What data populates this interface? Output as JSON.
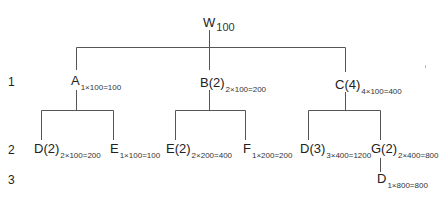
{
  "diagram": {
    "type": "tree",
    "levels": [
      {
        "id": "level-1",
        "label": "1"
      },
      {
        "id": "level-2",
        "label": "2"
      },
      {
        "id": "level-3",
        "label": "3"
      }
    ],
    "root": {
      "name": "W",
      "sub": "100"
    },
    "nodes": {
      "A": {
        "name": "A",
        "sub": "1×100=100"
      },
      "B": {
        "name": "B(2)",
        "sub": "2×100=200"
      },
      "C": {
        "name": "C(4)",
        "sub": "4×100=400"
      },
      "AD": {
        "name": "D(2)",
        "sub": "2×100=200"
      },
      "AE": {
        "name": "E",
        "sub": "1×100=100"
      },
      "BE": {
        "name": "E(2)",
        "sub": "2×200=400"
      },
      "BF": {
        "name": "F",
        "sub": "1×200=200"
      },
      "CD": {
        "name": "D(3)",
        "sub": "3×400=1200"
      },
      "CG": {
        "name": "G(2)",
        "sub": "2×400=800"
      },
      "GD": {
        "name": "D",
        "sub": "1×800=800"
      }
    },
    "edges": [
      [
        "W",
        "A"
      ],
      [
        "W",
        "B(2)"
      ],
      [
        "W",
        "C(4)"
      ],
      [
        "A",
        "D(2)"
      ],
      [
        "A",
        "E"
      ],
      [
        "B(2)",
        "E(2)"
      ],
      [
        "B(2)",
        "F"
      ],
      [
        "C(4)",
        "D(3)"
      ],
      [
        "C(4)",
        "G(2)"
      ],
      [
        "G(2)",
        "D"
      ]
    ],
    "line_color": "#555555"
  }
}
